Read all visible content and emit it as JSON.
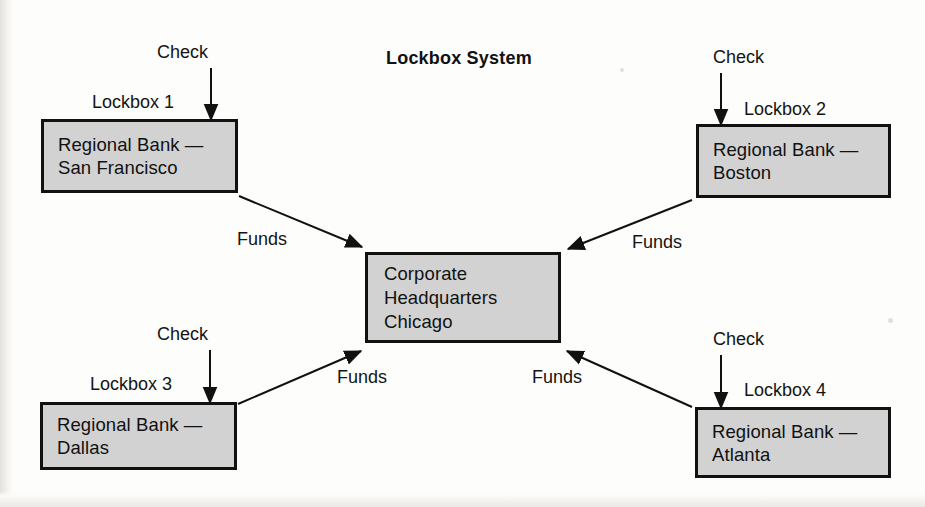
{
  "diagram": {
    "title": "Lockbox System",
    "type": "flow-diagram",
    "colors": {
      "box_fill": "#d2d2d2",
      "box_border": "#111111",
      "arrow": "#111111",
      "background": "#fdfdfc",
      "text": "#111111"
    },
    "center_node": {
      "id": "corporate-headquarters",
      "lines": [
        "Corporate",
        "Headquarters",
        "Chicago"
      ]
    },
    "nodes": [
      {
        "id": "lockbox-1",
        "caption": "Lockbox 1",
        "inbound_label": "Check",
        "outbound_label": "Funds",
        "lines": [
          "Regional Bank —",
          "San Francisco"
        ]
      },
      {
        "id": "lockbox-2",
        "caption": "Lockbox 2",
        "inbound_label": "Check",
        "outbound_label": "Funds",
        "lines": [
          "Regional Bank —",
          "Boston"
        ]
      },
      {
        "id": "lockbox-3",
        "caption": "Lockbox 3",
        "inbound_label": "Check",
        "outbound_label": "Funds",
        "lines": [
          "Regional Bank —",
          "Dallas"
        ]
      },
      {
        "id": "lockbox-4",
        "caption": "Lockbox 4",
        "inbound_label": "Check",
        "outbound_label": "Funds",
        "lines": [
          "Regional Bank —",
          "Atlanta"
        ]
      }
    ]
  }
}
